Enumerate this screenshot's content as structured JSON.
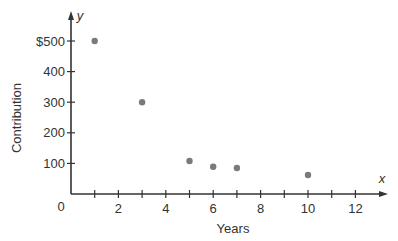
{
  "chart_data": {
    "type": "scatter",
    "title": "",
    "xlabel": "Years",
    "ylabel": "Contribution",
    "x_axis_variable": "x",
    "y_axis_variable": "y",
    "origin_label": "0",
    "xlim": [
      0,
      13
    ],
    "ylim": [
      0,
      550
    ],
    "x_ticks": [
      1,
      2,
      3,
      4,
      5,
      6,
      7,
      8,
      9,
      10,
      11,
      12
    ],
    "x_tick_labels": [
      "2",
      "4",
      "6",
      "8",
      "10",
      "12"
    ],
    "x_tick_label_values": [
      2,
      4,
      6,
      8,
      10,
      12
    ],
    "y_ticks": [
      100,
      200,
      300,
      400,
      500
    ],
    "y_tick_labels": [
      "100",
      "200",
      "300",
      "400",
      "$500"
    ],
    "grid": false,
    "legend": null,
    "point_color": "#7a7a7a",
    "axis_color": "#333333",
    "series": [
      {
        "name": "Contribution",
        "points": [
          {
            "x": 1,
            "y": 500
          },
          {
            "x": 3,
            "y": 300
          },
          {
            "x": 5,
            "y": 108
          },
          {
            "x": 6,
            "y": 89
          },
          {
            "x": 7,
            "y": 85
          },
          {
            "x": 10,
            "y": 62
          }
        ]
      }
    ]
  }
}
